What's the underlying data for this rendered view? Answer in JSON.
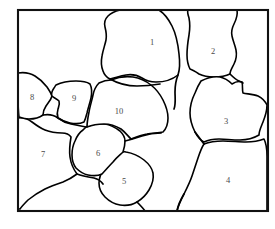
{
  "figure": {
    "type": "grain-structure-diagram",
    "background_color": "#ffffff",
    "line_color": "#000000",
    "label_color": "#4a4a4a",
    "frame": {
      "x": 18,
      "y": 10,
      "width": 250,
      "height": 201,
      "stroke_color": "#111111"
    }
  },
  "grains": [
    {
      "id": "grain-1",
      "label": "1",
      "label_x": 152,
      "label_y": 43
    },
    {
      "id": "grain-2",
      "label": "2",
      "label_x": 213,
      "label_y": 52
    },
    {
      "id": "grain-3",
      "label": "3",
      "label_x": 226,
      "label_y": 122
    },
    {
      "id": "grain-4",
      "label": "4",
      "label_x": 228,
      "label_y": 181
    },
    {
      "id": "grain-5",
      "label": "5",
      "label_x": 124,
      "label_y": 182
    },
    {
      "id": "grain-6",
      "label": "6",
      "label_x": 98,
      "label_y": 154
    },
    {
      "id": "grain-7",
      "label": "7",
      "label_x": 43,
      "label_y": 155
    },
    {
      "id": "grain-8",
      "label": "8",
      "label_x": 32,
      "label_y": 98
    },
    {
      "id": "grain-9",
      "label": "9",
      "label_x": 74,
      "label_y": 99
    },
    {
      "id": "grain-10",
      "label": "10",
      "label_x": 119,
      "label_y": 112
    }
  ]
}
